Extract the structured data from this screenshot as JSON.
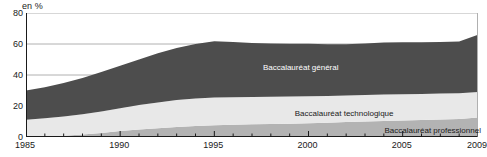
{
  "axis": {
    "unit_label": "en %",
    "y_ticks": [
      0,
      20,
      40,
      60,
      80
    ],
    "x_ticks": [
      1985,
      1990,
      1995,
      2000,
      2005,
      2009
    ]
  },
  "colors": {
    "general": "#4d4d4d",
    "technologique": "#e8e8e8",
    "professionnel": "#b3b3b3",
    "gridline": "#b0b0b0",
    "axis": "#1a1a1a",
    "background": "#ffffff",
    "label_light": "#ffffff",
    "label_dark": "#1a1a1a"
  },
  "labels": {
    "general": "Baccalauréat général",
    "technologique": "Baccalauréat technologique",
    "professionnel": "Baccalauréat professionnel"
  },
  "chart_data": {
    "type": "area",
    "title": "",
    "subtitle": "",
    "xlabel": "",
    "ylabel": "en %",
    "ylim": [
      0,
      80
    ],
    "xlim": [
      1985,
      2009
    ],
    "grid": true,
    "stacked": true,
    "legend_position": "inline-annotations",
    "x": [
      1985,
      1986,
      1987,
      1988,
      1989,
      1990,
      1991,
      1992,
      1993,
      1994,
      1995,
      1996,
      1997,
      1998,
      1999,
      2000,
      2001,
      2002,
      2003,
      2004,
      2005,
      2006,
      2007,
      2008,
      2009
    ],
    "series": [
      {
        "name": "Baccalauréat professionnel",
        "color": "#b3b3b3",
        "values": [
          0.0,
          0.3,
          0.8,
          1.6,
          2.6,
          3.8,
          4.9,
          5.7,
          6.5,
          7.1,
          7.6,
          7.9,
          8.2,
          8.4,
          8.6,
          8.9,
          9.2,
          9.6,
          10.0,
          10.4,
          10.7,
          11.0,
          11.3,
          11.6,
          12.6
        ]
      },
      {
        "name": "Baccalauréat technologique",
        "color": "#e8e8e8",
        "values": [
          11.2,
          11.8,
          12.4,
          13.1,
          13.9,
          14.8,
          15.7,
          16.6,
          17.3,
          17.7,
          17.9,
          17.8,
          17.6,
          17.5,
          17.5,
          17.4,
          17.3,
          17.2,
          17.1,
          17.0,
          16.9,
          16.8,
          16.7,
          16.6,
          16.4
        ]
      },
      {
        "name": "Baccalauréat général",
        "color": "#4d4d4d",
        "values": [
          18.8,
          20.0,
          21.6,
          23.4,
          25.5,
          27.4,
          29.4,
          31.7,
          33.6,
          35.2,
          36.2,
          35.6,
          34.9,
          34.4,
          34.1,
          33.8,
          33.3,
          33.0,
          33.2,
          33.6,
          33.6,
          33.4,
          33.3,
          33.4,
          37.0
        ]
      }
    ],
    "totals": [
      30.0,
      32.1,
      34.8,
      38.1,
      42.0,
      46.0,
      50.0,
      54.0,
      57.4,
      60.0,
      61.7,
      61.3,
      60.7,
      60.3,
      60.2,
      60.1,
      59.8,
      59.8,
      60.3,
      61.0,
      61.2,
      61.2,
      61.3,
      61.6,
      66.0
    ]
  }
}
